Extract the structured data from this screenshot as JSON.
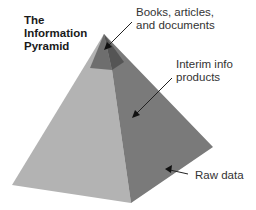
{
  "title_lines": [
    "The",
    "Information",
    "Pyramid"
  ],
  "labels": {
    "top": [
      "Books, articles,",
      "and documents"
    ],
    "middle": [
      "Interim info",
      "products"
    ],
    "bottom": "Raw data"
  },
  "colors": {
    "left_face": "#b3b3b3",
    "right_face": "#7a7a7a",
    "cap_left": "#6e6e6e",
    "cap_right": "#555555"
  }
}
